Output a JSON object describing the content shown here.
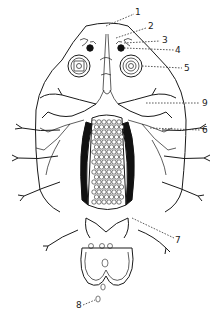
{
  "figure": {
    "style": "black ink line drawing on white background",
    "colors": {
      "ink": "#1a1a1a",
      "background": "#ffffff"
    },
    "labels": [
      {
        "id": "1",
        "text": "1"
      },
      {
        "id": "2",
        "text": "2"
      },
      {
        "id": "3",
        "text": "3"
      },
      {
        "id": "4",
        "text": "4"
      },
      {
        "id": "5",
        "text": "5"
      },
      {
        "id": "9",
        "text": "9"
      },
      {
        "id": "6",
        "text": "6"
      },
      {
        "id": "7",
        "text": "7"
      },
      {
        "id": "8",
        "text": "8"
      }
    ]
  }
}
